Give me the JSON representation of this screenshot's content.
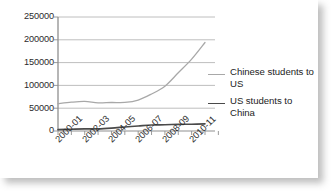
{
  "chart_data": {
    "type": "line",
    "title": "",
    "xlabel": "",
    "ylabel": "",
    "ylim": [
      0,
      250000
    ],
    "ytick_labels": [
      "250000",
      "200000",
      "150000",
      "100000",
      "50000",
      "0"
    ],
    "ytick_values": [
      250000,
      200000,
      150000,
      100000,
      50000,
      0
    ],
    "grid": true,
    "legend_position": "right",
    "x": [
      "2000-01",
      "2001-02",
      "2002-03",
      "2003-04",
      "2004-05",
      "2005-06",
      "2006-07",
      "2007-08",
      "2008-09",
      "2009-10",
      "2010-11",
      "2011-12"
    ],
    "xtick_labels": [
      "2000-01",
      "2002-03",
      "2004-05",
      "2006-07",
      "2008-09",
      "2010-11"
    ],
    "series": [
      {
        "name": "Chinese students to US",
        "color": "#a8a8a8",
        "values": [
          59939,
          63211,
          64757,
          61765,
          62523,
          62582,
          67723,
          81127,
          98235,
          127628,
          157558,
          194029
        ]
      },
      {
        "name": "US students to China",
        "color": "#4a4a4a",
        "values": [
          2942,
          3911,
          4737,
          4737,
          6389,
          8830,
          11064,
          13165,
          13674,
          14596,
          14887,
          15647
        ]
      }
    ]
  },
  "legend": {
    "entries": [
      {
        "label": "Chinese students to US"
      },
      {
        "label": "US students to China"
      }
    ]
  },
  "colors": {
    "series_chinese_to_us": "#a8a8a8",
    "series_us_to_china": "#4a4a4a",
    "gridline": "#b7b7b7",
    "axis": "#8f8f8f",
    "text": "#2b2b2b",
    "background": "#ffffff"
  }
}
